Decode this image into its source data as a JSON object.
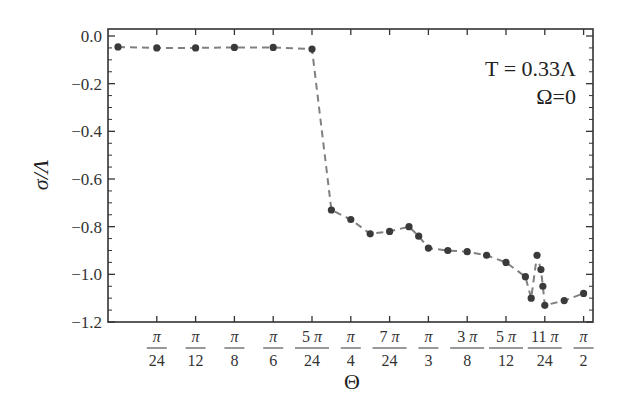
{
  "chart_data": {
    "type": "line",
    "title": "",
    "xlabel": "Θ",
    "ylabel": "σ/Λ",
    "annotations": [
      "T = 0.33Λ",
      "Ω=0"
    ],
    "x_unit": "π/24",
    "xlim": [
      0,
      12.25
    ],
    "ylim": [
      -1.2,
      0.02
    ],
    "x_ticks": [
      {
        "value": 1,
        "num": "π",
        "den": "24"
      },
      {
        "value": 2,
        "num": "π",
        "den": "12"
      },
      {
        "value": 3,
        "num": "π",
        "den": "8"
      },
      {
        "value": 4,
        "num": "π",
        "den": "6"
      },
      {
        "value": 5,
        "num": "5 π",
        "den": "24"
      },
      {
        "value": 6,
        "num": "π",
        "den": "4"
      },
      {
        "value": 7,
        "num": "7 π",
        "den": "24"
      },
      {
        "value": 8,
        "num": "π",
        "den": "3"
      },
      {
        "value": 9,
        "num": "3 π",
        "den": "8"
      },
      {
        "value": 10,
        "num": "5 π",
        "den": "12"
      },
      {
        "value": 11,
        "num": "11 π",
        "den": "24"
      },
      {
        "value": 12,
        "num": "π",
        "den": "2"
      }
    ],
    "y_ticks": [
      {
        "value": 0.0,
        "label": "0.0"
      },
      {
        "value": -0.2,
        "label": "−0.2"
      },
      {
        "value": -0.4,
        "label": "−0.4"
      },
      {
        "value": -0.6,
        "label": "−0.6"
      },
      {
        "value": -0.8,
        "label": "−0.8"
      },
      {
        "value": -1.0,
        "label": "−1.0"
      },
      {
        "value": -1.2,
        "label": "−1.2"
      }
    ],
    "series": [
      {
        "name": "sigma",
        "style": "dashed-with-markers",
        "color": "#808080",
        "marker_color": "#3a3a3a",
        "x": [
          0,
          1,
          2,
          3,
          4,
          5,
          5.5,
          6,
          6.5,
          7,
          7.5,
          7.75,
          8,
          8.5,
          9,
          9.5,
          10,
          10.5,
          10.65,
          10.8,
          10.9,
          10.95,
          11,
          11.5,
          12
        ],
        "y": [
          -0.046,
          -0.05,
          -0.05,
          -0.048,
          -0.048,
          -0.055,
          -0.73,
          -0.77,
          -0.83,
          -0.82,
          -0.8,
          -0.84,
          -0.89,
          -0.9,
          -0.905,
          -0.92,
          -0.95,
          -1.01,
          -1.1,
          -0.92,
          -0.98,
          -1.05,
          -1.13,
          -1.11,
          -1.08
        ]
      }
    ],
    "grid": false,
    "legend": "none"
  }
}
